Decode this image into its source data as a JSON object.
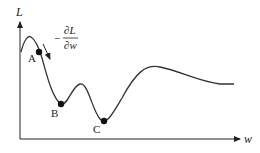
{
  "diagram": {
    "axes": {
      "y_label": "L",
      "x_label": "w"
    },
    "gradient_label": {
      "sign": "−",
      "numerator": "∂L",
      "denominator": "∂w"
    },
    "points": [
      {
        "label": "A",
        "role": "on descending slope"
      },
      {
        "label": "B",
        "role": "local minimum"
      },
      {
        "label": "C",
        "role": "global minimum"
      }
    ],
    "colors": {
      "curve": "#333333",
      "axis": "#222222",
      "point": "#111111"
    }
  }
}
